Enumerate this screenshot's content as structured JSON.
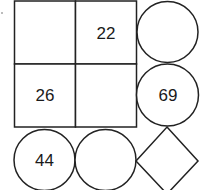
{
  "diagram": {
    "stroke_color": "#222222",
    "grid": {
      "cells": [
        {
          "row": 0,
          "col": 0,
          "value": ""
        },
        {
          "row": 0,
          "col": 1,
          "value": "22"
        },
        {
          "row": 1,
          "col": 0,
          "value": "26"
        },
        {
          "row": 1,
          "col": 1,
          "value": ""
        }
      ]
    },
    "right_circles": [
      {
        "position": "top",
        "value": ""
      },
      {
        "position": "middle",
        "value": "69"
      }
    ],
    "bottom_circles": [
      {
        "position": "left",
        "value": "44"
      },
      {
        "position": "center",
        "value": ""
      }
    ],
    "diamond": {
      "value": ""
    }
  }
}
